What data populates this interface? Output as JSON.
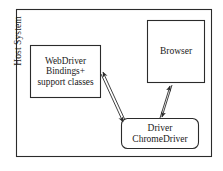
{
  "diagram": {
    "title": "Host System",
    "type": "block-diagram",
    "background": "#ffffff",
    "stroke_color": "#2b2b2b",
    "text_color": "#1a1a1a",
    "frame": {
      "name": "Host System",
      "label": "Host System",
      "label_orientation": "vertical",
      "x": 16,
      "y": 9,
      "width": 196,
      "height": 148,
      "shape": "rectangle"
    },
    "nodes": [
      {
        "id": "webdriver",
        "lines": [
          "WebDriver",
          "Bindings+",
          "support classes"
        ],
        "line1": "WebDriver",
        "line2": "Bindings+",
        "line3": "support classes",
        "shape": "rectangle",
        "x": 30,
        "y": 45,
        "width": 71,
        "height": 53
      },
      {
        "id": "browser",
        "lines": [
          "Browser"
        ],
        "line1": "Browser",
        "shape": "rectangle",
        "x": 147,
        "y": 20,
        "width": 58,
        "height": 63
      },
      {
        "id": "driver",
        "lines": [
          "Driver",
          "ChromeDriver"
        ],
        "line1": "Driver",
        "line2": "ChromeDriver",
        "shape": "rounded-rectangle",
        "x": 121,
        "y": 118,
        "width": 78,
        "height": 31
      }
    ],
    "connectors": [
      {
        "id": "webdriver-driver",
        "from": "webdriver",
        "to": "driver",
        "style": "double-line",
        "arrowheads": "both",
        "description": "bidirectional link between WebDriver bindings and Driver"
      },
      {
        "id": "driver-browser",
        "from": "driver",
        "to": "browser",
        "style": "double-line",
        "arrowheads": "both",
        "description": "bidirectional link between Driver and Browser"
      }
    ]
  }
}
